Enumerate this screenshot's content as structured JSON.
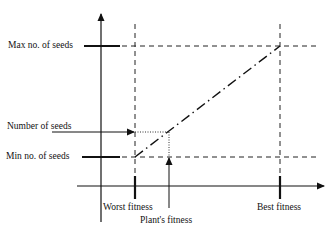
{
  "diagram": {
    "labels": {
      "max_seeds": "Max no. of seeds",
      "number_of_seeds": "Number of seeds",
      "min_seeds": "Min no. of seeds",
      "worst_fitness": "Worst fitness",
      "plants_fitness": "Plant's fitness",
      "best_fitness": "Best fitness"
    },
    "colors": {
      "line": "#111111",
      "background": "#ffffff"
    },
    "relationship": {
      "type": "linear",
      "from": {
        "x": "Worst fitness",
        "y": "Min no. of seeds"
      },
      "to": {
        "x": "Best fitness",
        "y": "Max no. of seeds"
      }
    }
  }
}
